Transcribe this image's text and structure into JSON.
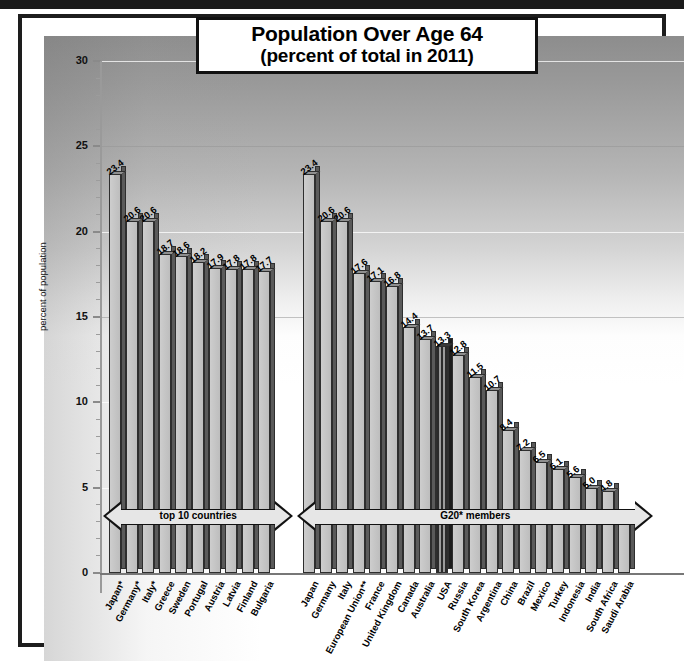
{
  "title": {
    "line1": "Population Over Age 64",
    "line2": "(percent of total in 2011)"
  },
  "chart_data": {
    "type": "bar",
    "title": "Population Over Age 64 (percent of total in 2011)",
    "xlabel": "",
    "ylabel": "percent of population",
    "ylim": [
      0,
      30
    ],
    "yticks": [
      0,
      5,
      10,
      15,
      20,
      25,
      30
    ],
    "ytick_labels": [
      "0",
      "5",
      "10",
      "15",
      "20",
      "25",
      "30"
    ],
    "grid": true,
    "legend": "none",
    "highlight": "USA",
    "groups": [
      {
        "name": "top 10 countries",
        "annotation": "top 10 countries",
        "categories": [
          "Japan*",
          "Germany*",
          "Italy*",
          "Greece",
          "Sweden",
          "Portugal",
          "Austria",
          "Latvia",
          "Finland",
          "Bulgaria"
        ],
        "values": [
          23.4,
          20.6,
          20.6,
          18.7,
          18.6,
          18.2,
          17.9,
          17.8,
          17.8,
          17.7
        ]
      },
      {
        "name": "G20* members",
        "annotation": "G20* members",
        "categories": [
          "Japan",
          "Germany",
          "Italy",
          "European Union**",
          "France",
          "United Kingdom",
          "Canada",
          "Australia",
          "USA",
          "Russia",
          "South Korea",
          "Argentina",
          "China",
          "Brazil",
          "Mexico",
          "Turkey",
          "Indonesia",
          "India",
          "South Africa",
          "Saudi Arabia"
        ],
        "values": [
          23.4,
          20.6,
          20.6,
          17.6,
          17.1,
          16.8,
          14.4,
          13.7,
          13.3,
          12.8,
          11.5,
          10.7,
          8.4,
          7.2,
          6.5,
          6.1,
          5.6,
          5.0,
          4.8,
          3.0
        ]
      }
    ]
  },
  "colors": {
    "bar_face": "#c6c6c6",
    "bar_side": "#5a5a5a",
    "highlight_bar": "#2b2b2b",
    "frame": "#1d1d1d",
    "text": "#000000"
  }
}
